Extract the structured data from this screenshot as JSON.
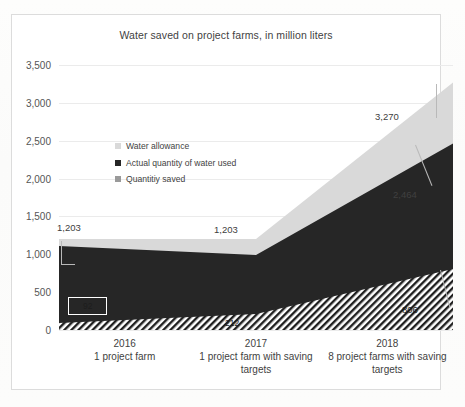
{
  "chart_data": {
    "type": "area",
    "title": "Water saved on project farms, in million liters",
    "xlabel": "",
    "ylabel": "",
    "ylim": [
      0,
      3500
    ],
    "ytick_step": 500,
    "yticks": [
      "0",
      "500",
      "1,000",
      "1,500",
      "2,000",
      "2,500",
      "3,000",
      "3,500"
    ],
    "grid": true,
    "legend_position": "inside-upper-left",
    "stacked": false,
    "categories": [
      "2016",
      "2017",
      "2018"
    ],
    "category_sublabels": [
      "1 project farm",
      "1 project farm with saving targets",
      "8 project farms with saving targets"
    ],
    "series": [
      {
        "name": "Water allowance",
        "color": "#d9d9d9",
        "fill": "solid",
        "values": [
          1203,
          1203,
          3270
        ],
        "labels": [
          "1,203",
          "1,203",
          "3,270"
        ]
      },
      {
        "name": "Actual quantity of water used",
        "color": "#262626",
        "fill": "solid",
        "values": [
          1111,
          991,
          2464
        ],
        "labels": [
          "",
          "",
          "2,464"
        ]
      },
      {
        "name": "Quantitiy saved",
        "color": "#808080",
        "fill": "diagonal-hatch",
        "values": [
          92,
          212,
          806
        ],
        "labels": [
          "92",
          "212",
          "806"
        ]
      }
    ],
    "annotations": [
      {
        "text": "1,203",
        "series": "Water allowance",
        "category": "2016"
      },
      {
        "text": "1,203",
        "series": "Water allowance",
        "category": "2017"
      },
      {
        "text": "3,270",
        "series": "Water allowance",
        "category": "2018"
      },
      {
        "text": "2,464",
        "series": "Actual quantity of water used",
        "category": "2018"
      },
      {
        "text": "92",
        "series": "Quantitiy saved",
        "category": "2016"
      },
      {
        "text": "212",
        "series": "Quantitiy saved",
        "category": "2017"
      },
      {
        "text": "806",
        "series": "Quantitiy saved",
        "category": "2018"
      }
    ]
  },
  "colors": {
    "allowance": "#d9d9d9",
    "actual": "#262626",
    "saved": "#808080",
    "gridline": "#ebebeb",
    "frame": "#dcdcdc",
    "text": "#3f3f3f"
  },
  "legend": {
    "items": [
      {
        "label": "Water allowance",
        "color": "#d9d9d9"
      },
      {
        "label": "Actual quantity of water used",
        "color": "#262626"
      },
      {
        "label": "Quantitiy saved",
        "color": "#9a9a9a"
      }
    ]
  },
  "yticks": {
    "t0": "0",
    "t500": "500",
    "t1000": "1,000",
    "t1500": "1,500",
    "t2000": "2,000",
    "t2500": "2,500",
    "t3000": "3,000",
    "t3500": "3,500"
  },
  "xaxis": {
    "cat0_year": "2016",
    "cat0_sub": "1 project farm",
    "cat1_year": "2017",
    "cat1_sub": "1 project farm with saving targets",
    "cat2_year": "2018",
    "cat2_sub": "8 project farms with saving targets"
  },
  "labels": {
    "l_1203_a": "1,203",
    "l_1203_b": "1,203",
    "l_3270": "3,270",
    "l_2464": "2,464",
    "l_92": "92",
    "l_212": "212",
    "l_806": "806"
  }
}
